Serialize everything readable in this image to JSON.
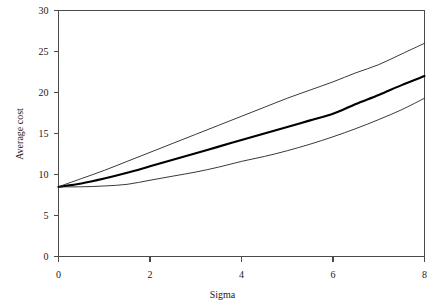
{
  "chart_data": {
    "type": "line",
    "title": "",
    "xlabel": "Sigma",
    "ylabel": "Average cost",
    "xlim": [
      0,
      8
    ],
    "ylim": [
      0,
      30
    ],
    "xticks": [
      "0",
      "2",
      "4",
      "6",
      "8"
    ],
    "yticks": [
      "0",
      "5",
      "10",
      "15",
      "20",
      "25",
      "30"
    ],
    "xtick_values": [
      0,
      2,
      4,
      6,
      8
    ],
    "ytick_values": [
      0,
      5,
      10,
      15,
      20,
      25,
      30
    ],
    "grid": false,
    "legend": "none",
    "x": [
      0,
      0.5,
      1,
      1.5,
      2,
      2.5,
      3,
      3.5,
      4,
      4.5,
      5,
      5.5,
      6,
      6.5,
      7,
      7.5,
      8
    ],
    "series": [
      {
        "name": "upper",
        "style": "thin",
        "color": "#222222",
        "width": 0.9,
        "values": [
          8.5,
          9.5,
          10.5,
          11.6,
          12.7,
          13.8,
          14.9,
          16.0,
          17.1,
          18.2,
          19.3,
          20.3,
          21.3,
          22.4,
          23.4,
          24.7,
          26.0
        ]
      },
      {
        "name": "middle",
        "style": "thick",
        "color": "#000000",
        "width": 2.1,
        "values": [
          8.5,
          8.9,
          9.5,
          10.2,
          11.0,
          11.8,
          12.6,
          13.4,
          14.2,
          15.0,
          15.8,
          16.6,
          17.4,
          18.6,
          19.7,
          20.9,
          22.0
        ]
      },
      {
        "name": "lower",
        "style": "thin",
        "color": "#222222",
        "width": 0.9,
        "values": [
          8.5,
          8.5,
          8.6,
          8.8,
          9.3,
          9.8,
          10.3,
          10.9,
          11.6,
          12.2,
          12.9,
          13.7,
          14.6,
          15.6,
          16.7,
          17.9,
          19.3
        ]
      }
    ]
  }
}
